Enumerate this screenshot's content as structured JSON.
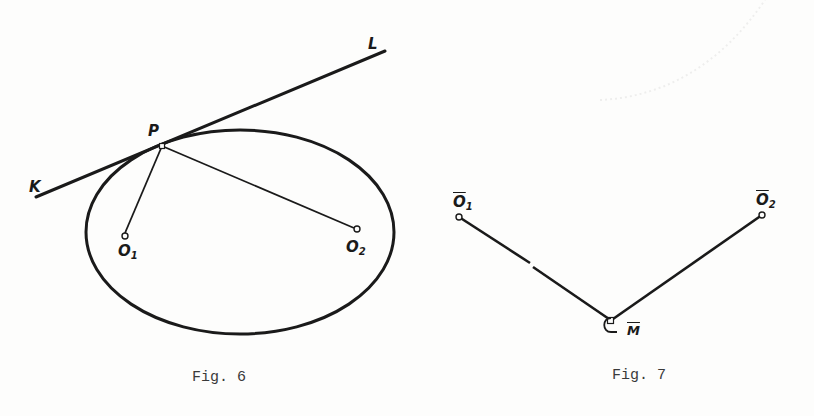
{
  "figures": [
    {
      "id": "fig6",
      "caption": "Fig. 6",
      "description": "Ellipse with foci O1 and O2, point P on ellipse, tangent line KL at P; segments P-O1 and P-O2 drawn",
      "ellipse": {
        "cx": 240,
        "cy": 232,
        "rx": 154,
        "ry": 102
      },
      "tangent_line": {
        "from": [
          36,
          197
        ],
        "to": [
          385,
          51
        ]
      },
      "points": {
        "P": [
          162,
          146
        ],
        "O1": [
          125,
          236
        ],
        "O2": [
          357,
          229
        ]
      },
      "labels": {
        "K": "K",
        "L": "L",
        "P": "P",
        "O1_main": "O",
        "O1_sub": "1",
        "O2_main": "O",
        "O2_sub": "2"
      }
    },
    {
      "id": "fig7",
      "caption": "Fig. 7",
      "description": "Two segments from Ō1 and Ō2 meeting at point M̄ forming a V shape",
      "points": {
        "O1bar": [
          459,
          217
        ],
        "O2bar": [
          762,
          215
        ],
        "Mbar": [
          611,
          321
        ]
      },
      "labels": {
        "O1bar_main": "O",
        "O1bar_sub": "1",
        "O2bar_main": "O",
        "O2bar_sub": "2",
        "Mbar": "M"
      }
    }
  ],
  "colors": {
    "ink": "#1a1a1a",
    "caption_ink": "#3a3a3a",
    "paper": "#fdfdfc"
  }
}
